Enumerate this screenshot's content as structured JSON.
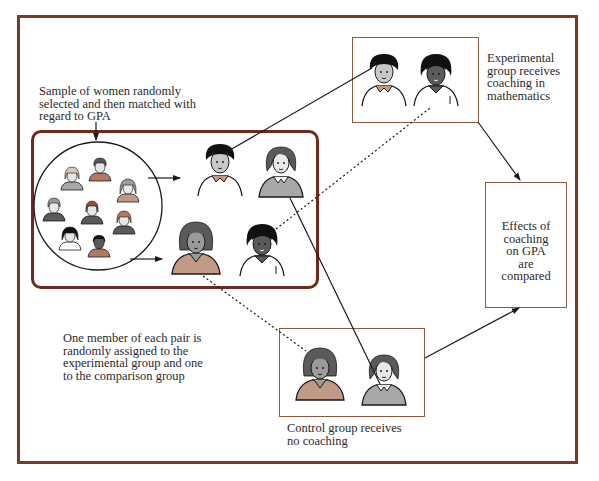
{
  "diagram": {
    "colors": {
      "frame": "#7a3b22",
      "box_border": "#8a5a40",
      "sample_box_border": "#6e2a1a",
      "hair_dark": "#111111",
      "hair_gray": "#5a5a5a",
      "skin_gray": "#9a9a9a",
      "shirt_tan": "#c19a86",
      "shirt_gray": "#a8a8a8",
      "line": "#1a1a1a"
    },
    "labels": {
      "sample": [
        "Sample of women randomly",
        "selected and then matched with",
        "regard to GPA"
      ],
      "experimental": [
        "Experimental",
        "group receives",
        "coaching in",
        "mathematics"
      ],
      "results": [
        "Effects of",
        "coaching",
        "on GPA",
        "are",
        "compared"
      ],
      "assignment": [
        "One member of each pair is",
        "randomly assigned to the",
        "experimental group and one",
        "to the comparison group"
      ],
      "control": [
        "Control group receives",
        "no coaching"
      ]
    },
    "nodes": [
      {
        "id": "sample",
        "label": "Sample of women randomly selected and then matched with regard to GPA"
      },
      {
        "id": "pairs",
        "label": "Matched pairs"
      },
      {
        "id": "experimental",
        "label": "Experimental group receives coaching in mathematics"
      },
      {
        "id": "control",
        "label": "Control group receives no coaching"
      },
      {
        "id": "results",
        "label": "Effects of coaching on GPA are compared"
      }
    ],
    "edges": [
      {
        "from": "sample",
        "to": "pairs",
        "style": "solid-arrow"
      },
      {
        "from": "pairs",
        "to": "experimental",
        "style": "solid/dashed"
      },
      {
        "from": "pairs",
        "to": "control",
        "style": "solid/dashed"
      },
      {
        "from": "experimental",
        "to": "results",
        "style": "solid-arrow"
      },
      {
        "from": "control",
        "to": "results",
        "style": "solid-arrow"
      }
    ]
  }
}
